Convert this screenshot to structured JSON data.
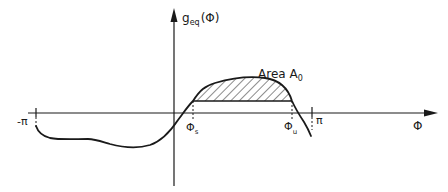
{
  "diagram": {
    "type": "function-plot",
    "y_axis": {
      "label_main": "g",
      "label_sub": "eq",
      "label_arg": "(Φ)"
    },
    "x_axis": {
      "label": "Φ"
    },
    "ticks": {
      "minus_pi": "-π",
      "phi_s_main": "Φ",
      "phi_s_sub": "s",
      "phi_u_main": "Φ",
      "phi_u_sub": "u",
      "pi": "π"
    },
    "annotation": {
      "area_text": "Area A",
      "area_sub": "0"
    },
    "colors": {
      "ink": "#1a1a1a",
      "background": "#ffffff"
    }
  }
}
